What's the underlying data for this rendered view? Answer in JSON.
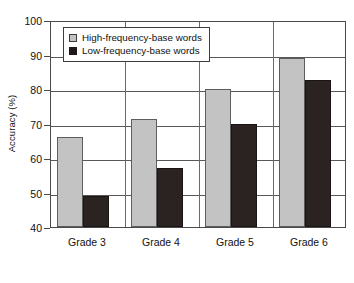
{
  "chart_data": {
    "type": "bar",
    "title": "",
    "xlabel": "",
    "ylabel": "Accuracy (%)",
    "categories": [
      "Grade 3",
      "Grade 4",
      "Grade 5",
      "Grade 6"
    ],
    "series": [
      {
        "name": "High-frequency-base words",
        "color": "#c3c3c3",
        "values": [
          66,
          71.2,
          80,
          89
        ]
      },
      {
        "name": "Low-frequency-base words",
        "color": "#2a2322",
        "values": [
          49,
          57.2,
          70,
          82.6
        ]
      }
    ],
    "ylim": [
      40,
      100
    ],
    "yticks": [
      40,
      50,
      60,
      70,
      80,
      90,
      100
    ],
    "ytick_labels": [
      "40",
      "50",
      "60",
      "70",
      "80",
      "90",
      "100"
    ],
    "grid": true,
    "legend_position": "upper-left",
    "legend_entries": [
      "High-frequency-base words",
      "Low-frequency-base words"
    ]
  }
}
